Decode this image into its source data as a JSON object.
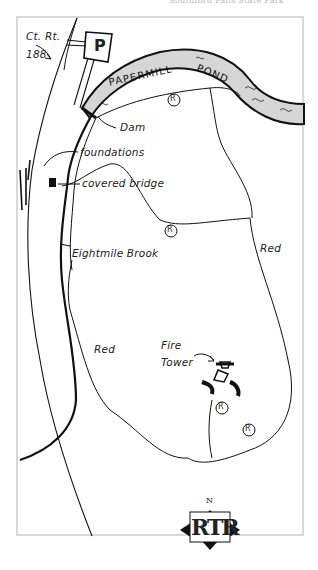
{
  "header": {
    "title": "Southford Falls State Park"
  },
  "map": {
    "road": {
      "label_line1": "Ct. Rt.",
      "label_line2": "188"
    },
    "parking": {
      "label": "P"
    },
    "pond": {
      "label_left": "PAPERMILL",
      "label_sep": "-",
      "label_right": "POND",
      "fill": "#d6d6d6"
    },
    "callouts": {
      "dam": "Dam",
      "foundations": "foundations",
      "covered_bridge": "covered bridge",
      "brook": "Eightmile Brook",
      "fire_tower_line1": "Fire",
      "fire_tower_line2": "Tower"
    },
    "trail_labels": {
      "red_east": "Red",
      "red_west": "Red"
    },
    "trail_markers": [
      "R",
      "R",
      "R",
      "R"
    ],
    "compass": {
      "north": "N",
      "logo": "RTR"
    },
    "colors": {
      "ink": "#111111",
      "frame": "#d9d9d9",
      "pond": "#d6d6d6"
    }
  }
}
